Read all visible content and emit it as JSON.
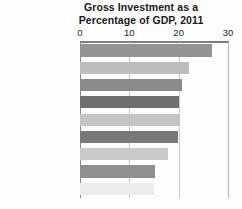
{
  "chart_data": {
    "type": "bar",
    "orientation": "horizontal",
    "title": "Gross Investment as a Percentage of GDP, 2011",
    "title_lines": [
      "Gross Investment as a",
      "Percentage of GDP, 2011"
    ],
    "xlabel": "",
    "ylabel": "",
    "xlim": [
      0,
      30
    ],
    "xticks": [
      0,
      10,
      20,
      30
    ],
    "xtick_labels": [
      "0",
      "10",
      "20",
      "30"
    ],
    "grid": true,
    "grid_axis": "x",
    "legend": false,
    "axis_position": "top",
    "categories": [
      "South Korea",
      "Canada",
      "Japan",
      "Mexico",
      "France",
      "Italy",
      "Germany",
      "United States",
      "United Kingdom"
    ],
    "values": [
      26.8,
      22.0,
      20.6,
      20.1,
      20.0,
      19.8,
      17.9,
      15.2,
      15.0
    ],
    "bar_colors": [
      "#949494",
      "#bdbdbd",
      "#8a8a8a",
      "#6e6e6e",
      "#c4c4c4",
      "#787878",
      "#c9c9c9",
      "#8f8f8f",
      "#ececec"
    ]
  },
  "colors": {
    "grid": "#c8c8c8",
    "axis": "#7d7d7d",
    "text": "#161616",
    "background": "#fdfdfd"
  }
}
